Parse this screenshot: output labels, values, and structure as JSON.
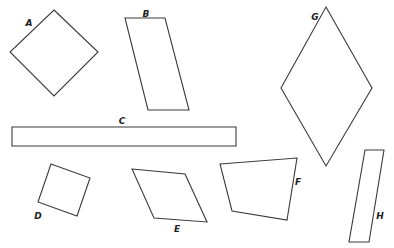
{
  "diagram": {
    "stroke_color": "#3a3a3a",
    "background": "#ffffff",
    "shapes": [
      {
        "id": "A",
        "label": "A",
        "kind": "square",
        "points": "54,10 98,52 54,96 10,52",
        "label_pos": [
          29,
          23
        ]
      },
      {
        "id": "B",
        "label": "B",
        "kind": "parallelogram",
        "points": "125,18 165,18 189,110 148,110",
        "label_pos": [
          146,
          14
        ]
      },
      {
        "id": "C",
        "label": "C",
        "kind": "rectangle",
        "points": "12,127 236,127 236,146 12,146",
        "label_pos": [
          122,
          121
        ]
      },
      {
        "id": "D",
        "label": "D",
        "kind": "square",
        "points": "51,164 90,178 77,216 38,202",
        "label_pos": [
          38,
          216
        ]
      },
      {
        "id": "E",
        "label": "E",
        "kind": "parallelogram",
        "points": "132,169 185,174 207,222 154,218",
        "label_pos": [
          177,
          229
        ]
      },
      {
        "id": "F",
        "label": "F",
        "kind": "trapezoid",
        "points": "220,164 297,158 287,220 232,211",
        "label_pos": [
          298,
          182
        ]
      },
      {
        "id": "G",
        "label": "G",
        "kind": "rhombus",
        "points": "326,7 372,88 326,166 281,88",
        "label_pos": [
          315,
          17
        ]
      },
      {
        "id": "H",
        "label": "H",
        "kind": "parallelogram",
        "points": "365,150 384,150 369,242 349,242",
        "label_pos": [
          380,
          216
        ]
      }
    ]
  }
}
